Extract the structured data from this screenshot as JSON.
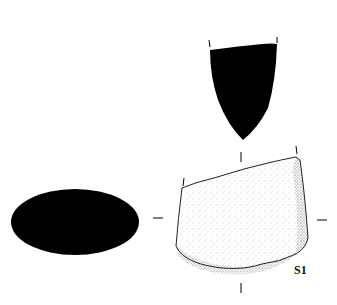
{
  "figure": {
    "label": "S1",
    "views": [
      "section-top",
      "section-side",
      "face-view"
    ],
    "colors": {
      "ink": "#000000",
      "background": "#ffffff",
      "stipple": "#555555"
    }
  }
}
